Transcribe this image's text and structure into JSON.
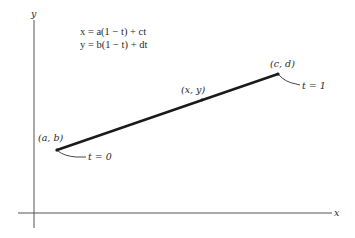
{
  "diagram": {
    "type": "parametric line segment",
    "axes": {
      "x_label": "x",
      "y_label": "y"
    },
    "equations": [
      "x = a(1 − t) + ct",
      "y = b(1 − t) + dt"
    ],
    "points": [
      {
        "label": "(a, b)",
        "annotation": "t = 0",
        "role": "start"
      },
      {
        "label": "(x, y)",
        "annotation": "",
        "role": "general"
      },
      {
        "label": "(c, d)",
        "annotation": "t = 1",
        "role": "end"
      }
    ],
    "colors": {
      "line": "#1a1a1a",
      "axis": "#555555",
      "text": "#2a2a2a"
    }
  }
}
